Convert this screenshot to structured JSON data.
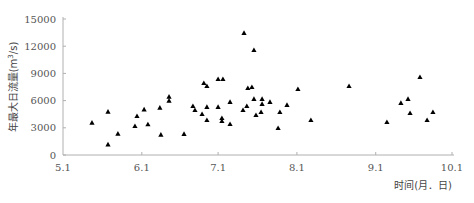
{
  "chart_data": {
    "type": "scatter",
    "title": "",
    "xlabel": "时间(月．日)",
    "ylabel": "年最大日流量(m³/s)",
    "ylabel_main": "年最大日流量(m",
    "ylabel_sup": "3",
    "ylabel_tail": "/s)",
    "x_unit": "days since 5.1",
    "xlim": [
      0,
      153
    ],
    "ylim": [
      0,
      15000
    ],
    "grid": false,
    "legend": null,
    "marker": "triangle",
    "marker_color": "#000000",
    "axis_color": "#b0b0b0",
    "x_ticks": [
      {
        "label": "5.1",
        "value": 0
      },
      {
        "label": "6.1",
        "value": 31
      },
      {
        "label": "7.1",
        "value": 61
      },
      {
        "label": "8.1",
        "value": 92
      },
      {
        "label": "9.1",
        "value": 123
      },
      {
        "label": "10.1",
        "value": 153
      }
    ],
    "y_ticks": [
      {
        "label": "0",
        "value": 0
      },
      {
        "label": "3000",
        "value": 3000
      },
      {
        "label": "6000",
        "value": 6000
      },
      {
        "label": "9000",
        "value": 9000
      },
      {
        "label": "12000",
        "value": 12000
      },
      {
        "label": "15000",
        "value": 15000
      }
    ],
    "points": [
      {
        "x": 11.4,
        "y": 3560
      },
      {
        "x": 17.7,
        "y": 4780
      },
      {
        "x": 21.6,
        "y": 2350
      },
      {
        "x": 17.7,
        "y": 1180
      },
      {
        "x": 29.1,
        "y": 4300
      },
      {
        "x": 28.3,
        "y": 3200
      },
      {
        "x": 31.9,
        "y": 5040
      },
      {
        "x": 33.4,
        "y": 3390
      },
      {
        "x": 38.1,
        "y": 5220
      },
      {
        "x": 41.7,
        "y": 6430
      },
      {
        "x": 41.7,
        "y": 5990
      },
      {
        "x": 38.5,
        "y": 2240
      },
      {
        "x": 47.6,
        "y": 2320
      },
      {
        "x": 51.1,
        "y": 5400
      },
      {
        "x": 51.9,
        "y": 4960
      },
      {
        "x": 54.7,
        "y": 4520
      },
      {
        "x": 55.4,
        "y": 7940
      },
      {
        "x": 56.6,
        "y": 7610
      },
      {
        "x": 56.6,
        "y": 5300
      },
      {
        "x": 56.6,
        "y": 3860
      },
      {
        "x": 61.0,
        "y": 8380
      },
      {
        "x": 62.9,
        "y": 8380
      },
      {
        "x": 61.0,
        "y": 5300
      },
      {
        "x": 62.5,
        "y": 4080
      },
      {
        "x": 62.5,
        "y": 3750
      },
      {
        "x": 65.7,
        "y": 5850
      },
      {
        "x": 65.7,
        "y": 3420
      },
      {
        "x": 71.2,
        "y": 13460
      },
      {
        "x": 75.1,
        "y": 11580
      },
      {
        "x": 70.8,
        "y": 4960
      },
      {
        "x": 72.3,
        "y": 5400
      },
      {
        "x": 72.7,
        "y": 7390
      },
      {
        "x": 74.3,
        "y": 7500
      },
      {
        "x": 75.1,
        "y": 6180
      },
      {
        "x": 75.9,
        "y": 4410
      },
      {
        "x": 78.3,
        "y": 6180
      },
      {
        "x": 78.3,
        "y": 5630
      },
      {
        "x": 77.9,
        "y": 4740
      },
      {
        "x": 81.4,
        "y": 5850
      },
      {
        "x": 84.6,
        "y": 2980
      },
      {
        "x": 85.3,
        "y": 4740
      },
      {
        "x": 88.1,
        "y": 5520
      },
      {
        "x": 92.4,
        "y": 7280
      },
      {
        "x": 97.5,
        "y": 3860
      },
      {
        "x": 112.5,
        "y": 7610
      },
      {
        "x": 127.4,
        "y": 3640
      },
      {
        "x": 132.9,
        "y": 5740
      },
      {
        "x": 135.7,
        "y": 6180
      },
      {
        "x": 136.5,
        "y": 4630
      },
      {
        "x": 140.4,
        "y": 8600
      },
      {
        "x": 143.2,
        "y": 3860
      },
      {
        "x": 145.5,
        "y": 4740
      }
    ]
  }
}
